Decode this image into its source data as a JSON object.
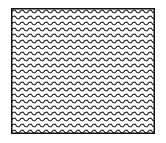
{
  "figure": {
    "pattern": "zigzag",
    "line_color": "#1a1a1a",
    "background_color": "#ffffff",
    "border_color": "#111111",
    "wave_period_px": 8,
    "line_spacing_px": 6,
    "rows": 21
  }
}
